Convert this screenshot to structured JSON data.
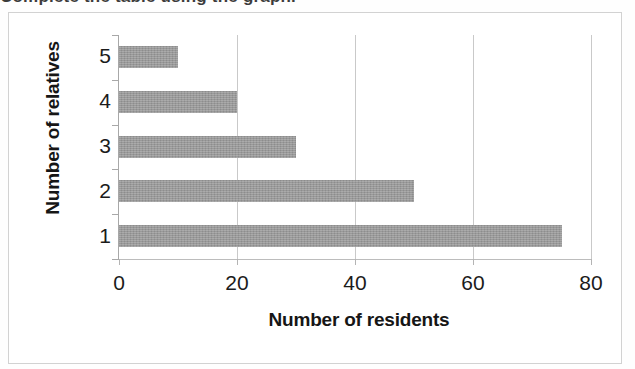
{
  "page": {
    "clipped_text_above": "Complete the table using the graph.",
    "bar_color": "#9a9a9a",
    "gridline_color": "#c9c9c9",
    "axis_color": "#a8a8a8",
    "text_color": "#161616",
    "frame_color": "#d2d2d2"
  },
  "chart_data": {
    "type": "bar",
    "orientation": "horizontal",
    "title": "",
    "subtitle": "",
    "xlabel": "Number of residents",
    "ylabel": "Number of relatives",
    "categories": [
      "1",
      "2",
      "3",
      "4",
      "5"
    ],
    "values": [
      75,
      50,
      30,
      20,
      10
    ],
    "series": [
      {
        "name": "Number of residents",
        "values": [
          75,
          50,
          30,
          20,
          10
        ]
      }
    ],
    "bars": [
      {
        "category": "5",
        "value": 10
      },
      {
        "category": "4",
        "value": 20
      },
      {
        "category": "3",
        "value": 30
      },
      {
        "category": "2",
        "value": 50
      },
      {
        "category": "1",
        "value": 75
      }
    ],
    "xlim": [
      0,
      80
    ],
    "x_ticks": [
      0,
      20,
      40,
      60,
      80
    ],
    "x_tick_labels": [
      "0",
      "20",
      "40",
      "60",
      "80"
    ],
    "y_tick_labels_top_to_bottom": [
      "5",
      "4",
      "3",
      "2",
      "1"
    ],
    "grid": {
      "vertical": true,
      "horizontal": false
    },
    "legend": {
      "visible": false,
      "position": "none"
    }
  }
}
